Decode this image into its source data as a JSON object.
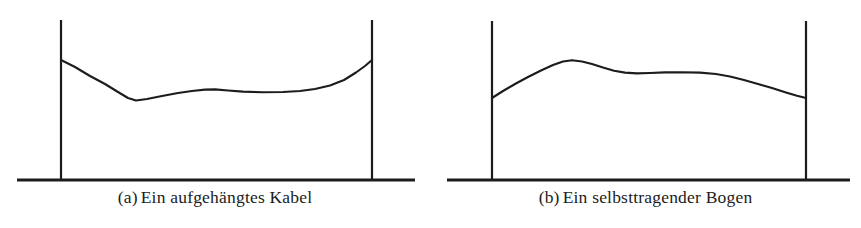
{
  "figure": {
    "background_color": "#ffffff",
    "ink_color": "#1c1c1c",
    "width": 861,
    "height": 228,
    "panels": [
      {
        "id": "a",
        "tag": "(a)",
        "caption": "Ein aufgehängtes Kabel",
        "full_caption": "(a) Ein aufgehängtes Kabel",
        "ground": {
          "x1": 17,
          "x2": 415,
          "y": 180
        },
        "posts": [
          {
            "name": "left-post",
            "x": 61,
            "y_top": 20,
            "y_bottom": 180,
            "attach_y": 60
          },
          {
            "name": "right-post",
            "x": 372,
            "y_top": 20,
            "y_bottom": 180,
            "attach_y": 60
          }
        ],
        "curve_name": "hanging-cable",
        "curve_points": "61,60 75,67 90,76 105,84 118,92 128,98 136,100.5 147,99 162,96 178,93 192,91 205,89.6 215,89.4 228,90.5 243,91.6 262,92.2 283,92 300,91 315,89 330,85.5 344,80 356,72.5 365,66 372,60"
      },
      {
        "id": "b",
        "tag": "(b)",
        "caption": "Ein selbsttragender Bogen",
        "full_caption": "(b) Ein selbsttragender Bogen",
        "ground": {
          "x1": 447,
          "x2": 850,
          "y": 180
        },
        "posts": [
          {
            "name": "left-post",
            "x": 492,
            "y_top": 21,
            "y_bottom": 180,
            "attach_y": 98
          },
          {
            "name": "right-post",
            "x": 806,
            "y_top": 21,
            "y_bottom": 180,
            "attach_y": 98
          }
        ],
        "curve_name": "self-supporting-arch",
        "curve_points": "492,98 503,91 515,84 528,77 541,70.5 553,65 563,61.5 572,60.3 582,61.5 592,64 603,67.5 614,70.7 625,72.6 637,73.4 650,73 665,72.4 682,72.2 700,72.6 716,74 730,76.5 744,80 758,84 772,88 786,92.5 797,95.8 806,98"
      }
    ]
  }
}
